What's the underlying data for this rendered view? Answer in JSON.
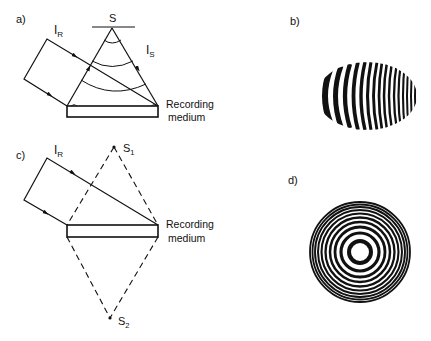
{
  "panels": {
    "a": {
      "label": "a)",
      "source_label": "S",
      "reference_beam_label": "I",
      "reference_beam_sub": "R",
      "signal_beam_label": "I",
      "signal_beam_sub": "S",
      "medium_label_line1": "Recording",
      "medium_label_line2": "medium"
    },
    "b": {
      "label": "b)",
      "description": "Off-axis hologram fringe pattern (curved fringes in elliptical area)",
      "fringe_count": 16
    },
    "c": {
      "label": "c)",
      "source1_label": "S",
      "source1_sub": "1",
      "source2_label": "S",
      "source2_sub": "2",
      "reference_beam_label": "I",
      "reference_beam_sub": "R",
      "medium_label_line1": "Recording",
      "medium_label_line2": "medium"
    },
    "d": {
      "label": "d)",
      "description": "Concentric ring (zone plate) fringe pattern",
      "ring_count": 10
    }
  },
  "colors": {
    "ink": "#111111",
    "background": "#ffffff"
  }
}
